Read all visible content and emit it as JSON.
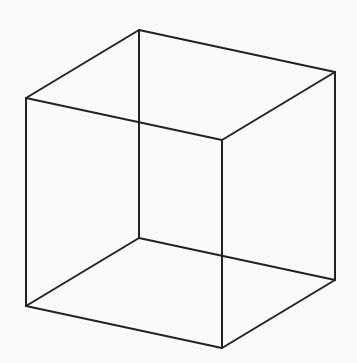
{
  "figure": {
    "stroke_color": "#222222",
    "background_color": "#fafafa",
    "vertices": {
      "A": [
        139,
        30
      ],
      "B": [
        26,
        98
      ],
      "C": [
        335,
        72
      ],
      "D": [
        222,
        140
      ],
      "E": [
        139,
        238
      ],
      "F": [
        26,
        306
      ],
      "G": [
        335,
        280
      ],
      "H": [
        222,
        348
      ]
    },
    "edges": [
      [
        "A",
        "B"
      ],
      [
        "A",
        "C"
      ],
      [
        "B",
        "D"
      ],
      [
        "C",
        "D"
      ],
      [
        "A",
        "E"
      ],
      [
        "B",
        "F"
      ],
      [
        "C",
        "G"
      ],
      [
        "D",
        "H"
      ],
      [
        "E",
        "F"
      ],
      [
        "E",
        "G"
      ],
      [
        "F",
        "H"
      ],
      [
        "G",
        "H"
      ]
    ]
  }
}
